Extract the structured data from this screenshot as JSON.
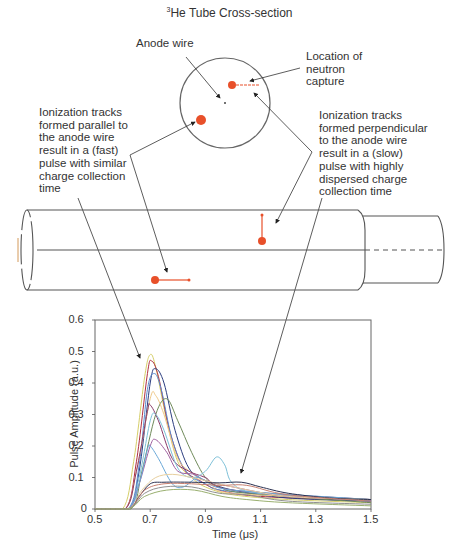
{
  "diagram": {
    "title_sup": "3",
    "title": "He Tube Cross-section",
    "labels": {
      "anode_wire": "Anode wire",
      "neutron_capture": "Location of\nneutron\ncapture",
      "parallel_tracks": "Ionization tracks\nformed parallel to\nthe anode wire\nresult in a (fast)\npulse with similar\ncharge collection\ntime",
      "perpendicular_tracks": "Ionization tracks\nformed perpendicular\nto the anode wire\nresult in a (slow)\npulse with highly\ndispersed charge\ncollection time"
    },
    "colors": {
      "outline": "#555555",
      "track": "#e8502a",
      "arrow": "#333333"
    }
  },
  "chart_data": {
    "type": "line",
    "title": "",
    "xlabel": "Time (μs)",
    "ylabel": "Pulse Amplitude (a.u.)",
    "xlim": [
      0.5,
      1.5
    ],
    "ylim": [
      0,
      0.6
    ],
    "xticks": [
      "0.5",
      "0.7",
      "0.9",
      "1.1",
      "1.3",
      "1.5"
    ],
    "yticks": [
      "0",
      "0.1",
      "0.2",
      "0.3",
      "0.4",
      "0.5",
      "0.6"
    ],
    "grid": false,
    "legend": "none",
    "annotations": [
      "fast pulses (parallel tracks) peak near 0.7 μs",
      "slow pulses (perpendicular tracks) broad plateau ~0.08 out to 1.1 μs"
    ],
    "series": [
      {
        "name": "pulse-1",
        "color": "#d6cf6a",
        "points": [
          [
            0.5,
            0
          ],
          [
            0.6,
            0
          ],
          [
            0.64,
            0.15
          ],
          [
            0.68,
            0.42
          ],
          [
            0.7,
            0.49
          ],
          [
            0.72,
            0.45
          ],
          [
            0.76,
            0.28
          ],
          [
            0.8,
            0.15
          ],
          [
            0.85,
            0.1
          ],
          [
            0.9,
            0.07
          ],
          [
            1.0,
            0.045
          ],
          [
            1.2,
            0.03
          ],
          [
            1.5,
            0.02
          ]
        ]
      },
      {
        "name": "pulse-2",
        "color": "#b03040",
        "points": [
          [
            0.5,
            0
          ],
          [
            0.61,
            0
          ],
          [
            0.65,
            0.15
          ],
          [
            0.69,
            0.43
          ],
          [
            0.705,
            0.47
          ],
          [
            0.73,
            0.42
          ],
          [
            0.77,
            0.25
          ],
          [
            0.82,
            0.13
          ],
          [
            0.88,
            0.09
          ],
          [
            0.95,
            0.06
          ],
          [
            1.1,
            0.04
          ],
          [
            1.5,
            0.025
          ]
        ]
      },
      {
        "name": "pulse-3",
        "color": "#2c3e80",
        "points": [
          [
            0.5,
            0
          ],
          [
            0.62,
            0
          ],
          [
            0.66,
            0.12
          ],
          [
            0.7,
            0.4
          ],
          [
            0.72,
            0.445
          ],
          [
            0.75,
            0.4
          ],
          [
            0.79,
            0.25
          ],
          [
            0.84,
            0.13
          ],
          [
            0.9,
            0.09
          ],
          [
            1.0,
            0.06
          ],
          [
            1.2,
            0.035
          ],
          [
            1.5,
            0.025
          ]
        ]
      },
      {
        "name": "pulse-4",
        "color": "#5a8ad0",
        "points": [
          [
            0.5,
            0
          ],
          [
            0.62,
            0
          ],
          [
            0.66,
            0.14
          ],
          [
            0.69,
            0.38
          ],
          [
            0.715,
            0.43
          ],
          [
            0.74,
            0.38
          ],
          [
            0.78,
            0.22
          ],
          [
            0.83,
            0.12
          ],
          [
            0.9,
            0.08
          ],
          [
            1.0,
            0.055
          ],
          [
            1.5,
            0.025
          ]
        ]
      },
      {
        "name": "pulse-5",
        "color": "#6f8a5a",
        "points": [
          [
            0.5,
            0
          ],
          [
            0.63,
            0
          ],
          [
            0.67,
            0.12
          ],
          [
            0.72,
            0.3
          ],
          [
            0.76,
            0.35
          ],
          [
            0.8,
            0.28
          ],
          [
            0.85,
            0.18
          ],
          [
            0.9,
            0.1
          ],
          [
            0.95,
            0.07
          ],
          [
            1.05,
            0.05
          ],
          [
            1.5,
            0.02
          ]
        ]
      },
      {
        "name": "pulse-6",
        "color": "#f0c98a",
        "points": [
          [
            0.5,
            0
          ],
          [
            0.61,
            0
          ],
          [
            0.65,
            0.12
          ],
          [
            0.7,
            0.35
          ],
          [
            0.72,
            0.36
          ],
          [
            0.75,
            0.3
          ],
          [
            0.8,
            0.16
          ],
          [
            0.86,
            0.11
          ],
          [
            0.92,
            0.08
          ],
          [
            1.0,
            0.05
          ],
          [
            1.5,
            0.03
          ]
        ]
      },
      {
        "name": "pulse-7",
        "color": "#8a3a6a",
        "points": [
          [
            0.5,
            0
          ],
          [
            0.61,
            0
          ],
          [
            0.65,
            0.12
          ],
          [
            0.69,
            0.31
          ],
          [
            0.7,
            0.33
          ],
          [
            0.73,
            0.28
          ],
          [
            0.78,
            0.16
          ],
          [
            0.84,
            0.12
          ],
          [
            0.9,
            0.1
          ],
          [
            1.0,
            0.06
          ],
          [
            1.5,
            0.03
          ]
        ]
      },
      {
        "name": "pulse-8",
        "color": "#7cc0d8",
        "points": [
          [
            0.5,
            0
          ],
          [
            0.62,
            0
          ],
          [
            0.66,
            0.1
          ],
          [
            0.7,
            0.28
          ],
          [
            0.72,
            0.3
          ],
          [
            0.75,
            0.25
          ],
          [
            0.8,
            0.13
          ],
          [
            0.85,
            0.1
          ],
          [
            0.9,
            0.12
          ],
          [
            0.94,
            0.165
          ],
          [
            0.97,
            0.14
          ],
          [
            1.0,
            0.08
          ],
          [
            1.1,
            0.05
          ],
          [
            1.5,
            0.03
          ]
        ]
      },
      {
        "name": "pulse-9",
        "color": "#a060a0",
        "points": [
          [
            0.5,
            0
          ],
          [
            0.62,
            0
          ],
          [
            0.66,
            0.08
          ],
          [
            0.7,
            0.2
          ],
          [
            0.72,
            0.22
          ],
          [
            0.76,
            0.18
          ],
          [
            0.8,
            0.12
          ],
          [
            0.86,
            0.11
          ],
          [
            0.9,
            0.09
          ],
          [
            1.0,
            0.07
          ],
          [
            1.2,
            0.04
          ],
          [
            1.5,
            0.03
          ]
        ]
      },
      {
        "name": "pulse-10",
        "color": "#6aa8d8",
        "points": [
          [
            0.5,
            0
          ],
          [
            0.62,
            0
          ],
          [
            0.66,
            0.08
          ],
          [
            0.69,
            0.19
          ],
          [
            0.7,
            0.2
          ],
          [
            0.73,
            0.16
          ],
          [
            0.78,
            0.08
          ],
          [
            0.82,
            0.07
          ],
          [
            0.87,
            0.1
          ],
          [
            0.9,
            0.09
          ],
          [
            1.0,
            0.06
          ],
          [
            1.5,
            0.03
          ]
        ]
      },
      {
        "name": "pulse-11",
        "color": "#e8d0a0",
        "points": [
          [
            0.5,
            0
          ],
          [
            0.62,
            0
          ],
          [
            0.67,
            0.06
          ],
          [
            0.72,
            0.1
          ],
          [
            0.78,
            0.11
          ],
          [
            0.85,
            0.1
          ],
          [
            0.9,
            0.09
          ],
          [
            1.0,
            0.07
          ],
          [
            1.2,
            0.04
          ],
          [
            1.5,
            0.03
          ]
        ]
      },
      {
        "name": "pulse-12",
        "color": "#2a3050",
        "points": [
          [
            0.5,
            0
          ],
          [
            0.62,
            0
          ],
          [
            0.66,
            0.04
          ],
          [
            0.7,
            0.08
          ],
          [
            0.75,
            0.085
          ],
          [
            0.85,
            0.085
          ],
          [
            0.95,
            0.083
          ],
          [
            1.03,
            0.085
          ],
          [
            1.1,
            0.07
          ],
          [
            1.2,
            0.05
          ],
          [
            1.35,
            0.035
          ],
          [
            1.5,
            0.03
          ]
        ]
      },
      {
        "name": "pulse-13",
        "color": "#c88070",
        "points": [
          [
            0.5,
            0
          ],
          [
            0.62,
            0
          ],
          [
            0.68,
            0.06
          ],
          [
            0.75,
            0.08
          ],
          [
            0.85,
            0.08
          ],
          [
            0.95,
            0.075
          ],
          [
            1.05,
            0.075
          ],
          [
            1.2,
            0.045
          ],
          [
            1.5,
            0.025
          ]
        ]
      },
      {
        "name": "pulse-14",
        "color": "#909090",
        "points": [
          [
            0.5,
            0
          ],
          [
            0.62,
            0
          ],
          [
            0.68,
            0.05
          ],
          [
            0.75,
            0.07
          ],
          [
            0.85,
            0.07
          ],
          [
            0.95,
            0.05
          ],
          [
            1.05,
            0.045
          ],
          [
            1.2,
            0.025
          ],
          [
            1.5,
            0.015
          ]
        ]
      },
      {
        "name": "pulse-15",
        "color": "#9ab070",
        "points": [
          [
            0.5,
            0
          ],
          [
            0.62,
            0
          ],
          [
            0.68,
            0.04
          ],
          [
            0.76,
            0.06
          ],
          [
            0.86,
            0.06
          ],
          [
            0.96,
            0.04
          ],
          [
            1.05,
            0.03
          ],
          [
            1.2,
            0.02
          ],
          [
            1.5,
            0.01
          ]
        ]
      }
    ]
  }
}
